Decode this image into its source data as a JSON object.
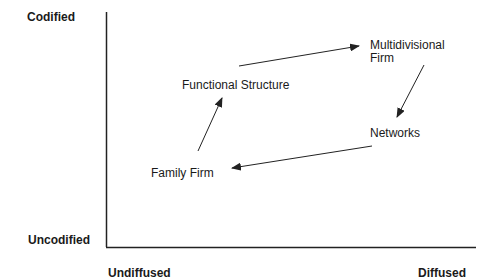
{
  "axes": {
    "y_top_label": "Codified",
    "y_bottom_label": "Uncodified",
    "x_left_label": "Undiffused",
    "x_right_label": "Diffused"
  },
  "nodes": [
    {
      "id": "functional-structure",
      "label": "Functional Structure"
    },
    {
      "id": "multidivisional-firm",
      "label_line1": "Multidivisional",
      "label_line2": "Firm"
    },
    {
      "id": "networks",
      "label": "Networks"
    },
    {
      "id": "family-firm",
      "label": "Family Firm"
    }
  ],
  "edges": [
    {
      "from": "family-firm",
      "to": "functional-structure"
    },
    {
      "from": "functional-structure",
      "to": "multidivisional-firm"
    },
    {
      "from": "multidivisional-firm",
      "to": "networks"
    },
    {
      "from": "networks",
      "to": "family-firm"
    }
  ],
  "colors": {
    "line": "#222222",
    "text": "#1a1a1a",
    "background": "#ffffff"
  }
}
